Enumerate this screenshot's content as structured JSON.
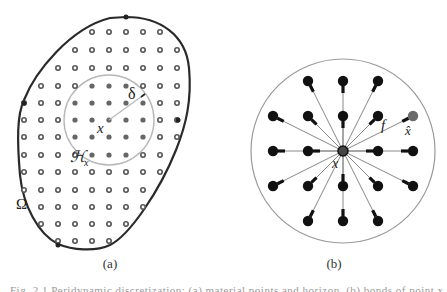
{
  "figure": {
    "panel_a": {
      "caption": "(a)",
      "domain_label": "Ω",
      "neighborhood_label": "ℋ",
      "neighborhood_subscript": "x",
      "center_label": "x",
      "radius_label": "δ",
      "grid": {
        "spacing_px": 17.2,
        "columns_x": [
          24,
          41,
          58,
          75,
          92,
          109,
          126,
          143,
          160,
          177
        ],
        "rows_y": [
          32,
          50,
          68,
          86,
          103,
          120,
          137,
          155,
          172,
          190,
          207,
          224,
          241
        ]
      },
      "colors": {
        "boundary": "#2a2a2a",
        "horizon_circle": "#b8b8b8",
        "outer_node": "#555555",
        "inner_node": "#666666"
      }
    },
    "panel_b": {
      "caption": "(b)",
      "center_label": "x",
      "bond_label": "f",
      "neighbor_label": "x̂",
      "center": [
        343,
        151
      ],
      "radius_px": 92,
      "spacing_px": 35,
      "colors": {
        "circle": "#999999",
        "bond": "#888888",
        "node": "#111111",
        "neighbor_highlight": "#6a6a6a"
      }
    },
    "cut_caption_text": "Fig. 2.1  Peridynamic discretization: (a) material points and horizon, (b) bonds of point x"
  }
}
